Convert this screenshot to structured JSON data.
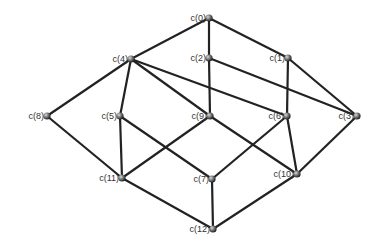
{
  "diagram": {
    "type": "graph",
    "nodes": [
      {
        "id": "c0",
        "label": "c(0)",
        "x": 209,
        "y": 18
      },
      {
        "id": "c1",
        "label": "c(1)",
        "x": 288,
        "y": 58
      },
      {
        "id": "c2",
        "label": "c(2)",
        "x": 209,
        "y": 58
      },
      {
        "id": "c3",
        "label": "c(3)",
        "x": 357,
        "y": 116
      },
      {
        "id": "c4",
        "label": "c(4)",
        "x": 131,
        "y": 59
      },
      {
        "id": "c5",
        "label": "c(5)",
        "x": 120,
        "y": 116
      },
      {
        "id": "c6",
        "label": "c(6)",
        "x": 287,
        "y": 116
      },
      {
        "id": "c7",
        "label": "c(7)",
        "x": 212,
        "y": 179
      },
      {
        "id": "c8",
        "label": "c(8)",
        "x": 47,
        "y": 116
      },
      {
        "id": "c9",
        "label": "c(9)",
        "x": 210,
        "y": 116
      },
      {
        "id": "c10",
        "label": "c(10)",
        "x": 297,
        "y": 174
      },
      {
        "id": "c11",
        "label": "c(11)",
        "x": 122,
        "y": 178
      },
      {
        "id": "c12",
        "label": "c(12)",
        "x": 213,
        "y": 229
      }
    ],
    "edges": [
      [
        "c0",
        "c4"
      ],
      [
        "c0",
        "c2"
      ],
      [
        "c0",
        "c1"
      ],
      [
        "c4",
        "c8"
      ],
      [
        "c4",
        "c5"
      ],
      [
        "c4",
        "c9"
      ],
      [
        "c4",
        "c6"
      ],
      [
        "c2",
        "c9"
      ],
      [
        "c2",
        "c3"
      ],
      [
        "c1",
        "c6"
      ],
      [
        "c1",
        "c3"
      ],
      [
        "c8",
        "c11"
      ],
      [
        "c5",
        "c11"
      ],
      [
        "c5",
        "c7"
      ],
      [
        "c9",
        "c11"
      ],
      [
        "c9",
        "c10"
      ],
      [
        "c6",
        "c7"
      ],
      [
        "c6",
        "c10"
      ],
      [
        "c3",
        "c10"
      ],
      [
        "c11",
        "c12"
      ],
      [
        "c7",
        "c12"
      ],
      [
        "c10",
        "c12"
      ]
    ],
    "edge_color": "#222222",
    "node_color": "#555555"
  }
}
